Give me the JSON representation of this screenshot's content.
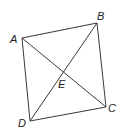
{
  "diagram": {
    "type": "quadrilateral-with-diagonals",
    "colors": {
      "line": "#3a3a3a",
      "text": "#222222",
      "background": "#ffffff"
    },
    "points": {
      "A": {
        "label": "A",
        "x": 22,
        "y": 38,
        "lx": 10,
        "ly": 43
      },
      "B": {
        "label": "B",
        "x": 97,
        "y": 23,
        "lx": 97,
        "ly": 20
      },
      "C": {
        "label": "C",
        "x": 106,
        "y": 107,
        "lx": 108,
        "ly": 112
      },
      "D": {
        "label": "D",
        "x": 30,
        "y": 121,
        "lx": 18,
        "ly": 127
      },
      "E": {
        "label": "E",
        "x": 63,
        "y": 72,
        "lx": 58,
        "ly": 88
      }
    },
    "segments": [
      [
        "A",
        "B"
      ],
      [
        "B",
        "C"
      ],
      [
        "C",
        "D"
      ],
      [
        "D",
        "A"
      ],
      [
        "A",
        "C"
      ],
      [
        "B",
        "D"
      ]
    ]
  }
}
